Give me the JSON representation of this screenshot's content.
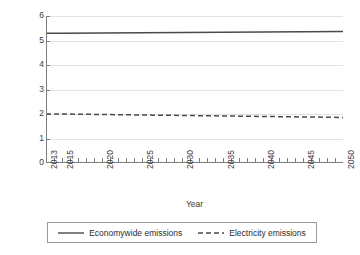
{
  "chart_data": {
    "type": "line",
    "title": "",
    "xlabel": "Year",
    "ylabel": "Billions of metric tons",
    "xlim": [
      2013,
      2050
    ],
    "ylim": [
      0,
      6
    ],
    "ytick_values": [
      0,
      1,
      2,
      3,
      4,
      5,
      6
    ],
    "ytick_labels": [
      "0",
      "1",
      "2",
      "3",
      "4",
      "5",
      "6"
    ],
    "xtick_values": [
      2013,
      2015,
      2020,
      2025,
      2030,
      2035,
      2040,
      2045,
      2050
    ],
    "xtick_labels": [
      "2013",
      "2015",
      "2020",
      "2025",
      "2030",
      "2035",
      "2040",
      "2045",
      "2050"
    ],
    "minor_xticks_every": 1,
    "grid": "horizontal",
    "legend_position": "below",
    "series": [
      {
        "name": "Economywide emissions",
        "style": "solid",
        "color": "#4a4a4a",
        "x": [
          2013,
          2015,
          2020,
          2025,
          2030,
          2035,
          2040,
          2045,
          2050
        ],
        "values": [
          5.3,
          5.3,
          5.31,
          5.32,
          5.33,
          5.34,
          5.35,
          5.36,
          5.37
        ]
      },
      {
        "name": "Electricity emissions",
        "style": "dashed",
        "color": "#4a4a4a",
        "x": [
          2013,
          2015,
          2020,
          2025,
          2030,
          2035,
          2040,
          2045,
          2050
        ],
        "values": [
          2.0,
          2.0,
          1.98,
          1.96,
          1.94,
          1.92,
          1.9,
          1.88,
          1.86
        ]
      }
    ]
  },
  "legend": {
    "items": [
      {
        "label": "Economywide emissions",
        "style": "solid"
      },
      {
        "label": "Electricity emissions",
        "style": "dashed"
      }
    ]
  },
  "colors": {
    "axis": "#7d7d7d",
    "grid": "#e2e2e2",
    "line": "#4a4a4a",
    "text": "#3a3a3a",
    "legend_border": "#9a9a9a",
    "background": "#ffffff"
  }
}
